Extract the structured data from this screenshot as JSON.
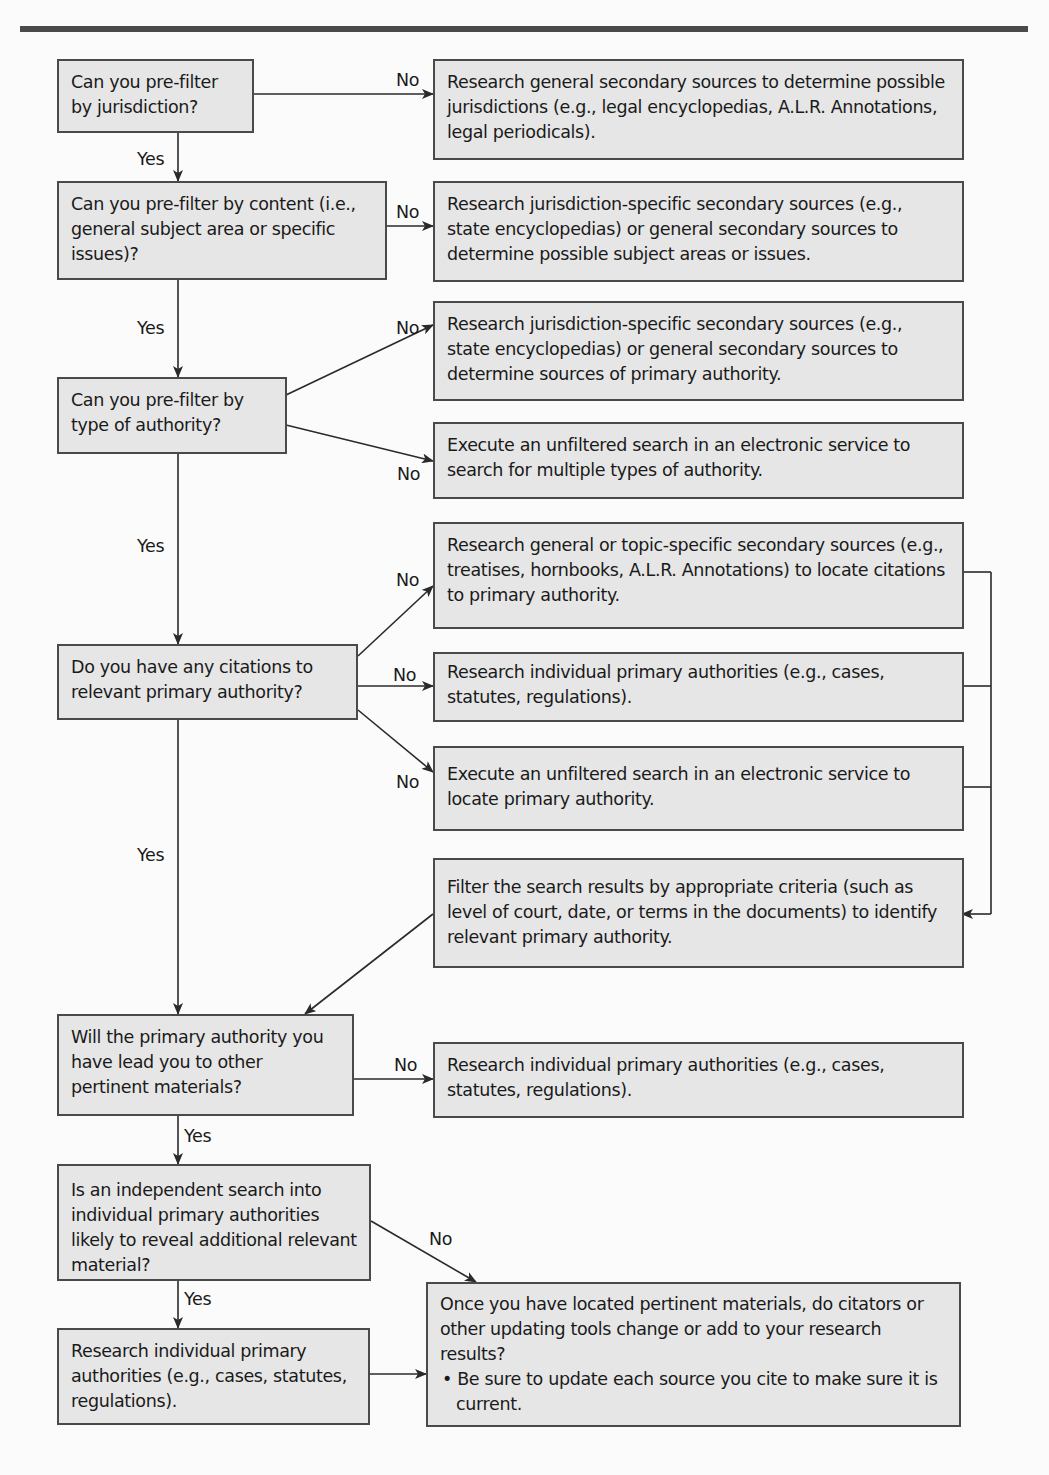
{
  "diagram": {
    "type": "flowchart",
    "questions": [
      {
        "id": "q1",
        "text": "Can you pre-filter by jurisdiction?"
      },
      {
        "id": "q2",
        "text": "Can you pre-filter by content (i.e., general subject area or specific issues)?"
      },
      {
        "id": "q3",
        "text": "Can you pre-filter by type of authority?"
      },
      {
        "id": "q4",
        "text": "Do you have any citations to relevant primary authority?"
      },
      {
        "id": "q5",
        "text": "Will the primary authority you have lead you to other pertinent materials?"
      },
      {
        "id": "q6",
        "text": "Is an independent search into individual primary authorities likely to reveal additional relevant material?"
      }
    ],
    "actions": [
      {
        "id": "a1",
        "text": "Research general secondary sources to determine possible jurisdictions (e.g., legal encyclopedias, A.L.R. Annotations, legal periodicals)."
      },
      {
        "id": "a2",
        "text": "Research jurisdiction-specific secondary sources (e.g., state encyclopedias) or general secondary sources to determine possible subject areas or issues."
      },
      {
        "id": "a3",
        "text": "Research jurisdiction-specific secondary sources (e.g., state encyclopedias) or general secondary sources to determine sources of primary authority."
      },
      {
        "id": "a4",
        "text": "Execute an unfiltered search in an electronic service to search for multiple types of authority."
      },
      {
        "id": "a5",
        "text": "Research general or topic-specific secondary sources (e.g., treatises, hornbooks, A.L.R. Annotations) to locate citations to primary authority."
      },
      {
        "id": "a6",
        "text": "Research individual primary authorities (e.g., cases, statutes, regulations)."
      },
      {
        "id": "a7",
        "text": "Execute  an unfiltered  search  in  an electronic service to locate primary authority."
      },
      {
        "id": "a8",
        "text": "Filter the search results by appropriate criteria (such as level of court, date, or terms in the documents) to identify relevant primary authority."
      },
      {
        "id": "a9",
        "text": "Research individual primary authorities (e.g., cases, statutes, regulations)."
      },
      {
        "id": "a10",
        "text": "Research individual primary authorities (e.g., cases, statutes, regulations)."
      },
      {
        "id": "a11",
        "text": "Once you have located pertinent materials, do citators or other updating tools change or add to your research results?",
        "bullet": "• Be sure to update each source you cite to make sure it is current."
      }
    ],
    "edge_labels": {
      "yes": "Yes",
      "no": "No"
    },
    "edges": [
      {
        "from": "q1",
        "to": "a1",
        "label": "No"
      },
      {
        "from": "q1",
        "to": "q2",
        "label": "Yes"
      },
      {
        "from": "q2",
        "to": "a2",
        "label": "No"
      },
      {
        "from": "q2",
        "to": "q3",
        "label": "Yes"
      },
      {
        "from": "q3",
        "to": "a3",
        "label": "No"
      },
      {
        "from": "q3",
        "to": "a4",
        "label": "No"
      },
      {
        "from": "q3",
        "to": "q4",
        "label": "Yes"
      },
      {
        "from": "q4",
        "to": "a5",
        "label": "No"
      },
      {
        "from": "q4",
        "to": "a6",
        "label": "No"
      },
      {
        "from": "q4",
        "to": "a7",
        "label": "No"
      },
      {
        "from": "a5",
        "to": "a8",
        "label": ""
      },
      {
        "from": "a6",
        "to": "a8",
        "label": ""
      },
      {
        "from": "a7",
        "to": "a8",
        "label": ""
      },
      {
        "from": "a8",
        "to": "q5",
        "label": ""
      },
      {
        "from": "q4",
        "to": "q5",
        "label": "Yes"
      },
      {
        "from": "q5",
        "to": "a9",
        "label": "No"
      },
      {
        "from": "q5",
        "to": "q6",
        "label": "Yes"
      },
      {
        "from": "q6",
        "to": "a11",
        "label": "No"
      },
      {
        "from": "q6",
        "to": "a10",
        "label": "Yes"
      },
      {
        "from": "a10",
        "to": "a11",
        "label": ""
      }
    ]
  }
}
